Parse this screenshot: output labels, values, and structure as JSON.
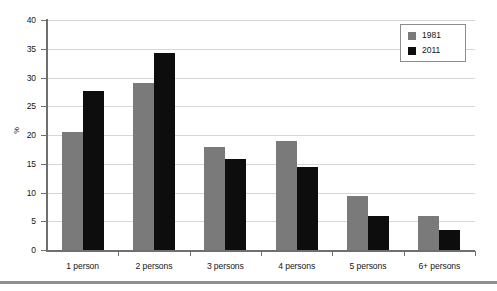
{
  "chart_data": {
    "type": "bar",
    "title": "",
    "subtitle": "",
    "xlabel": "",
    "ylabel": "%",
    "ylim": [
      0,
      40
    ],
    "ytick_step": 5,
    "yticks": [
      40,
      35,
      30,
      25,
      20,
      15,
      10,
      5,
      0
    ],
    "grid": true,
    "grid_axis": "y",
    "legend_position": "top-right",
    "categories": [
      "1 person",
      "2 persons",
      "3 persons",
      "4 persons",
      "5 persons",
      "6+ persons"
    ],
    "series": [
      {
        "name": "1981",
        "color": "#7a7a7a",
        "values": [
          20.5,
          29.0,
          17.9,
          18.9,
          9.4,
          6.0
        ]
      },
      {
        "name": "2011",
        "color": "#0d0d0d",
        "values": [
          27.6,
          34.2,
          15.9,
          14.5,
          6.0,
          3.5
        ]
      }
    ]
  },
  "legend": {
    "entries": [
      {
        "label": "1981",
        "color": "#7a7a7a"
      },
      {
        "label": "2011",
        "color": "#0d0d0d"
      }
    ]
  },
  "axes": {
    "y_title": "%",
    "y_tick_labels": [
      "40",
      "35",
      "30",
      "25",
      "20",
      "15",
      "10",
      "5",
      "0"
    ],
    "x_tick_labels": [
      "1 person",
      "2 persons",
      "3 persons",
      "4 persons",
      "5 persons",
      "6+ persons"
    ]
  },
  "colors": {
    "series_1981": "#7a7a7a",
    "series_2011": "#0d0d0d",
    "gridline": "#d7d7d7",
    "axis": "#6f6f6f",
    "rule": "#8e8e8e",
    "background": "#ffffff"
  }
}
